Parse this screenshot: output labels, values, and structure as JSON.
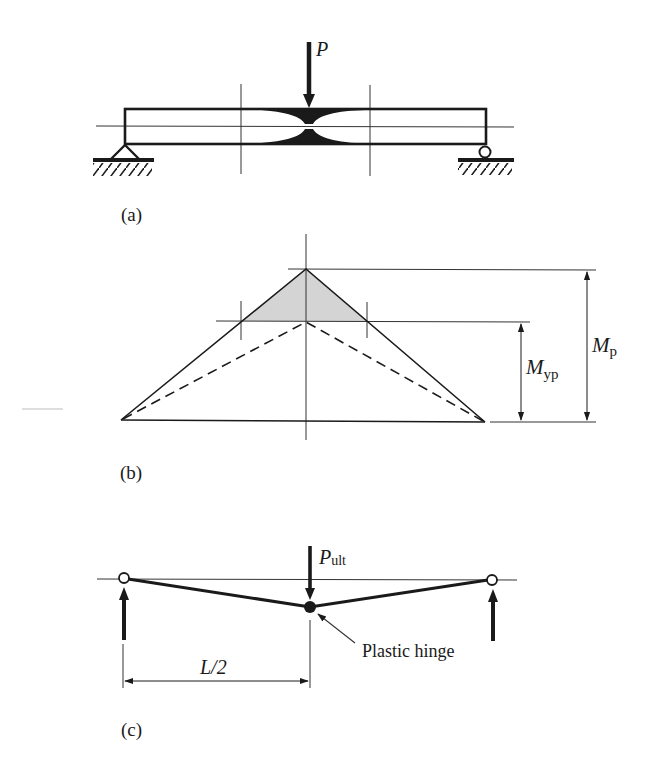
{
  "figure": {
    "part_a": {
      "caption": "(a)",
      "load_label": "P"
    },
    "part_b": {
      "caption": "(b)",
      "mp_label_main": "M",
      "mp_label_sub": "p",
      "myp_label_main": "M",
      "myp_label_sub": "yp"
    },
    "part_c": {
      "caption": "(c)",
      "load_label_main": "P",
      "load_label_sub": "ult",
      "hinge_label": "Plastic hinge",
      "span_label": "L/2"
    }
  },
  "colors": {
    "ink": "#1a1a1a",
    "thin_line": "#333333",
    "shade": "#d4d4d4",
    "stray": "#bdbdbd"
  }
}
